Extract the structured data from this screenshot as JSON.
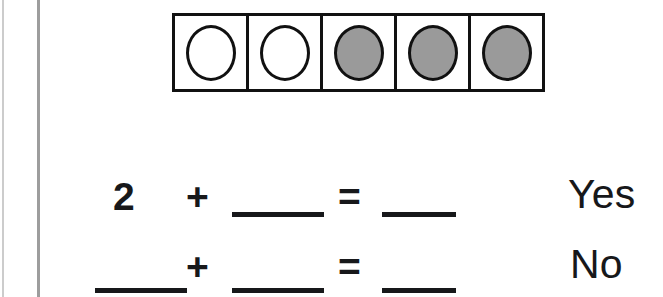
{
  "page": {
    "background_color": "#ffffff",
    "ink_color": "#17181a",
    "margin_rules": [
      {
        "name": "outer-margin-rule",
        "color": "#cccccc"
      },
      {
        "name": "inner-margin-rule",
        "color": "#9d9d9d"
      }
    ]
  },
  "ten_frame": {
    "label": "five-cell counter frame",
    "cell_count": 5,
    "border_color": "#111111",
    "filled_color": "#9a9a9a",
    "empty_color": "#ffffff",
    "cells": [
      {
        "index": 1,
        "state": "empty"
      },
      {
        "index": 2,
        "state": "empty"
      },
      {
        "index": 3,
        "state": "filled"
      },
      {
        "index": 4,
        "state": "filled"
      },
      {
        "index": 5,
        "state": "filled"
      }
    ],
    "empty_count": 2,
    "filled_count": 3
  },
  "equations": [
    {
      "id": "row-1",
      "addend_1": "2",
      "plus": "+",
      "addend_2": "",
      "equals": "=",
      "sum": "",
      "choice_label": "Yes"
    },
    {
      "id": "row-2",
      "addend_1": "",
      "plus": "+",
      "addend_2": "",
      "equals": "=",
      "sum": "",
      "choice_label": "No"
    }
  ]
}
